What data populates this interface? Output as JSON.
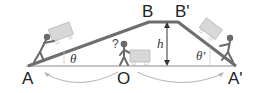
{
  "diagram": {
    "points": {
      "A": "A",
      "O": "O",
      "A_prime": "A'",
      "B": "B",
      "B_prime": "B'"
    },
    "labels": {
      "height": "h",
      "angle_left": "θ",
      "angle_right": "θ'",
      "question": "?"
    },
    "colors": {
      "ramp": "#6e6e6e",
      "ground": "#8a8a8a",
      "figure": "#6a6a6a",
      "cart": "#d4d4d4",
      "arrow": "#b0b0b0",
      "text": "#222222"
    }
  }
}
